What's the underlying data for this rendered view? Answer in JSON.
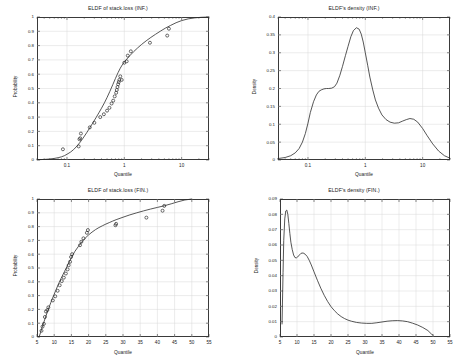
{
  "figure": {
    "background": "#ffffff",
    "axis_color": "#3a3a3a",
    "grid_color": "#d9d9d9",
    "curve_color": "#2b2b2b",
    "marker_color": "#2b2b2b"
  },
  "panels": {
    "top_left": {
      "title": "ELDF of stack.loss (INF.)",
      "xlabel": "Quantile",
      "ylabel": "Probability"
    },
    "top_right": {
      "title": "ELDF's density (INF.)",
      "xlabel": "Quantile",
      "ylabel": "Density"
    },
    "bottom_left": {
      "title": "ELDF of stack.loss (FIN.)",
      "xlabel": "Quantile",
      "ylabel": "Probability"
    },
    "bottom_right": {
      "title": "ELDF's density (FIN.)",
      "xlabel": "Quantile",
      "ylabel": "Density"
    }
  },
  "chart_data": [
    {
      "id": "top_left",
      "type": "line",
      "title": "ELDF of stack.loss (INF.)",
      "xlabel": "Quantile",
      "ylabel": "Probability",
      "xscale": "log",
      "xlim": [
        0.03,
        30
      ],
      "ylim": [
        0,
        1
      ],
      "xticks": [
        0.1,
        1,
        10
      ],
      "xticklabels": [
        "0.1",
        "1",
        "10"
      ],
      "yticks": [
        0,
        0.1,
        0.2,
        0.3,
        0.4,
        0.5,
        0.6,
        0.7,
        0.8,
        0.9,
        1
      ],
      "yticklabels": [
        "0",
        "0.1",
        "0.2",
        "0.3",
        "0.4",
        "0.5",
        "0.6",
        "0.7",
        "0.8",
        "0.9",
        "1"
      ],
      "grid": true,
      "legend": "none",
      "series": [
        {
          "name": "fitted CDF",
          "kind": "line",
          "x": [
            0.03,
            0.04,
            0.05,
            0.06,
            0.07,
            0.08,
            0.09,
            0.1,
            0.115,
            0.13,
            0.15,
            0.17,
            0.19,
            0.22,
            0.25,
            0.28,
            0.32,
            0.36,
            0.4,
            0.45,
            0.5,
            0.56,
            0.63,
            0.7,
            0.78,
            0.85,
            0.92,
            1.0,
            1.1,
            1.25,
            1.45,
            1.7,
            2.0,
            2.4,
            2.9,
            3.5,
            4.3,
            5.2,
            6.4,
            8.0,
            10.0,
            13.0,
            17.0,
            22.0,
            30.0
          ],
          "y": [
            0.002,
            0.004,
            0.007,
            0.011,
            0.016,
            0.022,
            0.03,
            0.04,
            0.055,
            0.072,
            0.098,
            0.125,
            0.152,
            0.19,
            0.225,
            0.257,
            0.295,
            0.33,
            0.362,
            0.4,
            0.437,
            0.48,
            0.527,
            0.57,
            0.612,
            0.642,
            0.665,
            0.685,
            0.705,
            0.73,
            0.757,
            0.783,
            0.808,
            0.833,
            0.857,
            0.879,
            0.902,
            0.922,
            0.941,
            0.96,
            0.975,
            0.987,
            0.994,
            0.998,
            1.0
          ]
        },
        {
          "name": "empirical points",
          "kind": "scatter",
          "marker": "open-circle",
          "x": [
            0.085,
            0.16,
            0.165,
            0.17,
            0.175,
            0.25,
            0.3,
            0.38,
            0.44,
            0.5,
            0.55,
            0.6,
            0.64,
            0.68,
            0.72,
            0.74,
            0.76,
            0.78,
            0.8,
            0.82,
            0.85,
            0.9,
            1.0,
            1.1,
            1.15,
            1.3,
            2.8,
            5.6,
            6.0
          ],
          "y": [
            0.075,
            0.095,
            0.145,
            0.152,
            0.185,
            0.228,
            0.26,
            0.3,
            0.32,
            0.345,
            0.365,
            0.395,
            0.415,
            0.445,
            0.47,
            0.49,
            0.51,
            0.53,
            0.545,
            0.56,
            0.585,
            0.56,
            0.68,
            0.69,
            0.73,
            0.76,
            0.82,
            0.87,
            0.918
          ]
        }
      ]
    },
    {
      "id": "top_right",
      "type": "line",
      "title": "ELDF's density (INF.)",
      "xlabel": "Quantile",
      "ylabel": "Density",
      "xscale": "log",
      "xlim": [
        0.03,
        30
      ],
      "ylim": [
        0,
        0.4
      ],
      "xticks": [
        0.1,
        1,
        10
      ],
      "xticklabels": [
        "0.1",
        "1",
        "10"
      ],
      "yticks": [
        0,
        0.05,
        0.1,
        0.15,
        0.2,
        0.25,
        0.3,
        0.35,
        0.4
      ],
      "yticklabels": [
        "0",
        "0.05",
        "0.1",
        "0.15",
        "0.2",
        "0.25",
        "0.3",
        "0.35",
        "0.4"
      ],
      "grid": true,
      "legend": "none",
      "series": [
        {
          "name": "density",
          "kind": "line",
          "x": [
            0.03,
            0.04,
            0.05,
            0.06,
            0.07,
            0.08,
            0.09,
            0.1,
            0.11,
            0.125,
            0.14,
            0.155,
            0.17,
            0.19,
            0.21,
            0.23,
            0.26,
            0.29,
            0.32,
            0.36,
            0.4,
            0.45,
            0.5,
            0.56,
            0.62,
            0.7,
            0.78,
            0.85,
            0.92,
            1.0,
            1.1,
            1.2,
            1.35,
            1.5,
            1.7,
            1.95,
            2.3,
            2.7,
            3.2,
            3.8,
            4.5,
            5.2,
            6.0,
            7.0,
            8.2,
            10.0,
            12.0,
            15.0,
            19.0,
            24.0,
            30.0
          ],
          "y": [
            0.004,
            0.007,
            0.012,
            0.02,
            0.032,
            0.05,
            0.074,
            0.103,
            0.133,
            0.163,
            0.182,
            0.192,
            0.196,
            0.199,
            0.2,
            0.2,
            0.201,
            0.205,
            0.215,
            0.237,
            0.262,
            0.292,
            0.318,
            0.345,
            0.362,
            0.37,
            0.366,
            0.352,
            0.33,
            0.3,
            0.265,
            0.232,
            0.196,
            0.168,
            0.145,
            0.126,
            0.113,
            0.106,
            0.103,
            0.104,
            0.109,
            0.113,
            0.116,
            0.114,
            0.106,
            0.088,
            0.068,
            0.045,
            0.025,
            0.012,
            0.005
          ]
        }
      ]
    },
    {
      "id": "bottom_left",
      "type": "line",
      "title": "ELDF of stack.loss (FIN.)",
      "xlabel": "Quantile",
      "ylabel": "Probability",
      "xscale": "linear",
      "xlim": [
        5,
        55
      ],
      "ylim": [
        0,
        1
      ],
      "xticks": [
        5,
        10,
        15,
        20,
        25,
        30,
        35,
        40,
        45,
        50,
        55
      ],
      "xticklabels": [
        "5",
        "10",
        "15",
        "20",
        "25",
        "30",
        "35",
        "40",
        "45",
        "50",
        "55"
      ],
      "yticks": [
        0,
        0.1,
        0.2,
        0.3,
        0.4,
        0.5,
        0.6,
        0.7,
        0.8,
        0.9,
        1
      ],
      "yticklabels": [
        "0",
        "0.1",
        "0.2",
        "0.3",
        "0.4",
        "0.5",
        "0.6",
        "0.7",
        "0.8",
        "0.9",
        "1"
      ],
      "grid": true,
      "legend": "none",
      "series": [
        {
          "name": "fitted CDF",
          "kind": "line",
          "x": [
            5.6,
            6.0,
            6.5,
            7.0,
            7.5,
            8.0,
            8.5,
            9.0,
            9.5,
            10.0,
            10.5,
            11.0,
            11.5,
            12.0,
            12.5,
            13.0,
            13.5,
            14.0,
            14.5,
            15.0,
            15.5,
            16.0,
            17.0,
            18.0,
            19.0,
            20.0,
            21.0,
            22.0,
            23.0,
            24.0,
            25.0,
            26.0,
            27.0,
            28.0,
            30.0,
            32.0,
            34.0,
            36.0,
            38.0,
            40.0,
            42.0,
            44.0,
            46.0,
            48.0,
            50.0
          ],
          "y": [
            0.0,
            0.03,
            0.07,
            0.108,
            0.145,
            0.18,
            0.215,
            0.248,
            0.28,
            0.31,
            0.34,
            0.37,
            0.398,
            0.425,
            0.45,
            0.475,
            0.5,
            0.525,
            0.55,
            0.575,
            0.598,
            0.62,
            0.655,
            0.688,
            0.716,
            0.74,
            0.76,
            0.778,
            0.793,
            0.806,
            0.818,
            0.829,
            0.84,
            0.85,
            0.868,
            0.885,
            0.9,
            0.914,
            0.927,
            0.939,
            0.951,
            0.965,
            0.98,
            0.993,
            1.0
          ]
        },
        {
          "name": "empirical points",
          "kind": "scatter",
          "marker": "open-circle",
          "x": [
            6.3,
            6.6,
            7.0,
            7.3,
            7.6,
            8.0,
            8.3,
            9.6,
            10.3,
            11.0,
            11.6,
            12.2,
            12.8,
            13.4,
            13.9,
            14.2,
            14.6,
            14.9,
            15.2,
            17.5,
            17.9,
            18.5,
            19.5,
            19.8,
            27.8,
            28.0,
            36.8,
            41.5,
            42.0
          ],
          "y": [
            0.045,
            0.075,
            0.095,
            0.145,
            0.185,
            0.195,
            0.215,
            0.265,
            0.295,
            0.335,
            0.375,
            0.405,
            0.43,
            0.46,
            0.49,
            0.52,
            0.545,
            0.58,
            0.6,
            0.665,
            0.69,
            0.715,
            0.755,
            0.775,
            0.81,
            0.82,
            0.865,
            0.915,
            0.95
          ]
        }
      ]
    },
    {
      "id": "bottom_right",
      "type": "line",
      "title": "ELDF's density (FIN.)",
      "xlabel": "Quantile",
      "ylabel": "Density",
      "xscale": "linear",
      "xlim": [
        5,
        55
      ],
      "ylim": [
        0,
        0.09
      ],
      "xticks": [
        5,
        10,
        15,
        20,
        25,
        30,
        35,
        40,
        45,
        50,
        55
      ],
      "xticklabels": [
        "5",
        "10",
        "15",
        "20",
        "25",
        "30",
        "35",
        "40",
        "45",
        "50",
        "55"
      ],
      "yticks": [
        0,
        0.01,
        0.02,
        0.03,
        0.04,
        0.05,
        0.06,
        0.07,
        0.08,
        0.09
      ],
      "yticklabels": [
        "0",
        "0.01",
        "0.02",
        "0.03",
        "0.04",
        "0.05",
        "0.06",
        "0.07",
        "0.08",
        "0.09"
      ],
      "grid": true,
      "legend": "none",
      "series": [
        {
          "name": "density",
          "kind": "line",
          "x": [
            5.6,
            5.7,
            5.9,
            6.1,
            6.4,
            6.7,
            7.0,
            7.3,
            7.6,
            7.9,
            8.2,
            8.6,
            9.0,
            9.4,
            9.8,
            10.2,
            10.7,
            11.2,
            11.8,
            12.4,
            13.0,
            13.6,
            14.2,
            15.0,
            16.0,
            17.0,
            18.0,
            19.0,
            20.0,
            21.0,
            22.0,
            23.0,
            24.0,
            25.0,
            26.0,
            27.5,
            29.0,
            30.5,
            32.0,
            33.5,
            35.0,
            36.5,
            38.0,
            39.5,
            41.0,
            42.5,
            44.0,
            45.5,
            47.0,
            48.5,
            49.6,
            50.0
          ],
          "y": [
            0.0085,
            0.02,
            0.042,
            0.063,
            0.077,
            0.0822,
            0.0828,
            0.08,
            0.074,
            0.0675,
            0.0618,
            0.057,
            0.0535,
            0.0518,
            0.0516,
            0.0522,
            0.0535,
            0.0546,
            0.0548,
            0.054,
            0.0525,
            0.05,
            0.047,
            0.0425,
            0.037,
            0.0318,
            0.0272,
            0.0232,
            0.0198,
            0.0172,
            0.015,
            0.0133,
            0.012,
            0.011,
            0.0103,
            0.0095,
            0.0091,
            0.0089,
            0.0089,
            0.0093,
            0.0098,
            0.0103,
            0.0106,
            0.0107,
            0.0105,
            0.01,
            0.009,
            0.0078,
            0.0062,
            0.0042,
            0.0018,
            0.0012
          ]
        }
      ]
    }
  ]
}
